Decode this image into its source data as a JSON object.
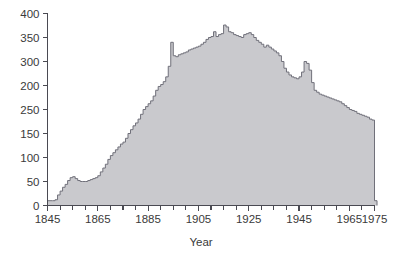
{
  "chart_data": {
    "type": "area",
    "title": "",
    "xlabel": "Year",
    "ylabel": "",
    "xlim": [
      1845,
      1975
    ],
    "ylim": [
      0,
      400
    ],
    "grid": false,
    "legend": null,
    "x_tick_labels": [
      "1845",
      "1865",
      "1885",
      "1905",
      "1925",
      "1945",
      "1965",
      "1975"
    ],
    "x_tick_values": [
      1845,
      1865,
      1885,
      1905,
      1925,
      1945,
      1965,
      1975
    ],
    "x_minor_tick_values": [
      1850,
      1855,
      1860,
      1870,
      1875,
      1880,
      1890,
      1895,
      1900,
      1910,
      1915,
      1920,
      1930,
      1935,
      1940,
      1950,
      1955,
      1960,
      1970
    ],
    "y_tick_labels": [
      "400",
      "350",
      "300",
      "200",
      "250",
      "150",
      "100",
      "50",
      "0"
    ],
    "y_tick_values": [
      400,
      350,
      300,
      250,
      200,
      150,
      100,
      50,
      0
    ],
    "colors": {
      "area_fill": "#c9c9cd",
      "area_outline": "#70707a",
      "axis": "#4a4a52",
      "text": "#3a3a3a",
      "background": "#ffffff"
    },
    "x": [
      1845,
      1846,
      1847,
      1848,
      1849,
      1850,
      1851,
      1852,
      1853,
      1854,
      1855,
      1856,
      1857,
      1858,
      1859,
      1860,
      1861,
      1862,
      1863,
      1864,
      1865,
      1866,
      1867,
      1868,
      1869,
      1870,
      1871,
      1872,
      1873,
      1874,
      1875,
      1876,
      1877,
      1878,
      1879,
      1880,
      1881,
      1882,
      1883,
      1884,
      1885,
      1886,
      1887,
      1888,
      1889,
      1890,
      1891,
      1892,
      1893,
      1894,
      1895,
      1896,
      1897,
      1898,
      1899,
      1900,
      1901,
      1902,
      1903,
      1904,
      1905,
      1906,
      1907,
      1908,
      1909,
      1910,
      1911,
      1912,
      1913,
      1914,
      1915,
      1916,
      1917,
      1918,
      1919,
      1920,
      1921,
      1922,
      1923,
      1924,
      1925,
      1926,
      1927,
      1928,
      1929,
      1930,
      1931,
      1932,
      1933,
      1934,
      1935,
      1936,
      1937,
      1938,
      1939,
      1940,
      1941,
      1942,
      1943,
      1944,
      1945,
      1946,
      1947,
      1948,
      1949,
      1950,
      1951,
      1952,
      1953,
      1954,
      1955,
      1956,
      1957,
      1958,
      1959,
      1960,
      1961,
      1962,
      1963,
      1964,
      1965,
      1966,
      1967,
      1968,
      1969,
      1970,
      1971,
      1972,
      1973,
      1974,
      1975
    ],
    "values": [
      10,
      10,
      10,
      12,
      22,
      30,
      38,
      44,
      52,
      58,
      60,
      56,
      52,
      50,
      50,
      50,
      52,
      54,
      56,
      58,
      62,
      70,
      78,
      86,
      96,
      104,
      110,
      116,
      122,
      128,
      132,
      140,
      150,
      158,
      166,
      172,
      180,
      190,
      200,
      206,
      212,
      218,
      228,
      240,
      248,
      252,
      258,
      268,
      290,
      340,
      312,
      310,
      314,
      316,
      318,
      320,
      324,
      326,
      328,
      330,
      332,
      336,
      340,
      346,
      350,
      352,
      362,
      352,
      356,
      358,
      376,
      372,
      362,
      360,
      356,
      354,
      352,
      350,
      356,
      358,
      360,
      356,
      350,
      344,
      340,
      336,
      330,
      334,
      330,
      326,
      322,
      318,
      312,
      300,
      286,
      278,
      272,
      268,
      266,
      264,
      268,
      278,
      300,
      296,
      282,
      256,
      240,
      236,
      232,
      230,
      228,
      226,
      224,
      222,
      220,
      218,
      216,
      212,
      208,
      204,
      200,
      198,
      196,
      192,
      190,
      188,
      186,
      184,
      180,
      178,
      10
    ]
  }
}
